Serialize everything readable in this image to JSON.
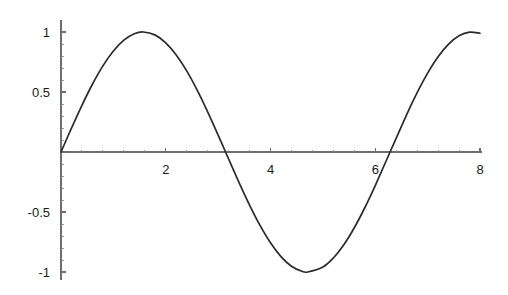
{
  "chart_data": {
    "type": "line",
    "title": "",
    "subtitle": "",
    "xlabel": "",
    "ylabel": "",
    "function": "sin(x)",
    "xlim": [
      0,
      8
    ],
    "ylim": [
      -1.08,
      1.08
    ],
    "grid": false,
    "legend": null,
    "legend_position": "none",
    "x_ticks_major": [
      2,
      4,
      6,
      8
    ],
    "x_tick_labels": [
      "2",
      "4",
      "6",
      "8"
    ],
    "x_ticks_minor": [
      0.4,
      0.8,
      1.2,
      1.6,
      2.4,
      2.8,
      3.2,
      3.6,
      4.4,
      4.8,
      5.2,
      5.6,
      6.4,
      6.8,
      7.2,
      7.6
    ],
    "y_ticks_major": [
      1,
      0.5,
      -0.5,
      -1
    ],
    "y_tick_labels": [
      "1",
      "0.5",
      "-0.5",
      "-1"
    ],
    "y_ticks_minor": [
      0.9,
      0.8,
      0.7,
      0.6,
      0.4,
      0.3,
      0.2,
      0.1,
      -0.1,
      -0.2,
      -0.3,
      -0.4,
      -0.6,
      -0.7,
      -0.8,
      -0.9
    ],
    "series": [
      {
        "name": "sin(x)",
        "color": "#2b2b2b",
        "x": [
          0,
          0.2,
          0.4,
          0.6,
          0.8,
          1,
          1.2,
          1.4,
          1.5708,
          1.8,
          2,
          2.2,
          2.4,
          2.6,
          2.8,
          3,
          3.1416,
          3.4,
          3.6,
          3.8,
          4,
          4.2,
          4.4,
          4.6,
          4.7124,
          5,
          5.2,
          5.4,
          5.6,
          5.8,
          6,
          6.2832,
          6.6,
          6.8,
          7,
          7.2,
          7.4,
          7.6,
          7.8,
          8
        ],
        "y": [
          0,
          0.1987,
          0.3894,
          0.5646,
          0.7174,
          0.8415,
          0.932,
          0.9854,
          1,
          0.9738,
          0.9093,
          0.8085,
          0.6755,
          0.5155,
          0.335,
          0.1411,
          0,
          -0.2555,
          -0.4425,
          -0.6119,
          -0.7568,
          -0.8716,
          -0.9516,
          -0.9937,
          -1,
          -0.9589,
          -0.8835,
          -0.7728,
          -0.6313,
          -0.4646,
          -0.2794,
          0,
          0.3115,
          0.4941,
          0.657,
          0.7937,
          0.8987,
          0.9679,
          0.999,
          0.9894
        ]
      }
    ],
    "axis_color": "#6e6e6e",
    "curve_color": "#2b2b2b",
    "background_color": "#ffffff"
  }
}
